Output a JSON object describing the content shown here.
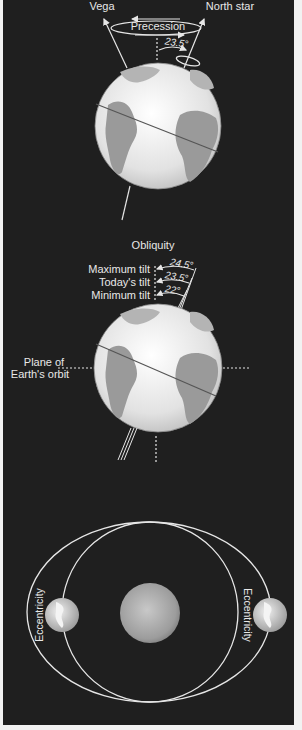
{
  "colors": {
    "background": "#1f1f1f",
    "border": "#f2f2f2",
    "line": "#e6e6e6",
    "ocean": "#e9e9e9",
    "land": "#9a9a9a",
    "sun": "#a8a8a8"
  },
  "precession": {
    "title": "Precession",
    "left_star": "Vega",
    "right_star": "North star",
    "angle": "23.5°"
  },
  "obliquity": {
    "title": "Obliquity",
    "tilts": [
      {
        "label": "Maximum tilt",
        "angle": "24.5°"
      },
      {
        "label": "Today's tilt",
        "angle": "23.5°"
      },
      {
        "label": "Minimum tilt",
        "angle": "22°"
      }
    ],
    "plane_label_line1": "Plane of",
    "plane_label_line2": "Earth's orbit"
  },
  "eccentricity": {
    "left_label": "Eccentricity",
    "right_label": "Eccentricity"
  }
}
